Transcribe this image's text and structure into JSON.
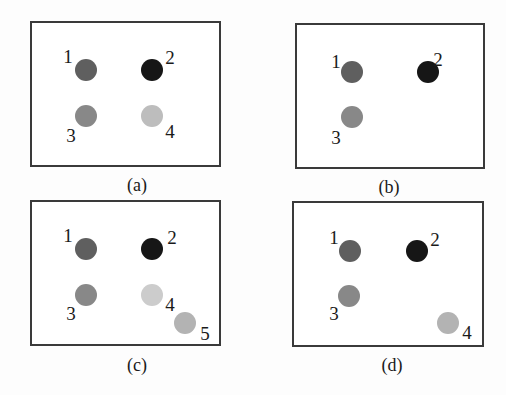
{
  "colors": {
    "dot1": "#5f5f5f",
    "dot2": "#161616",
    "dot3": "#888888",
    "dot4": "#bdbdbd",
    "dot5": "#b3b3b3",
    "border": "#3a3a3a"
  },
  "panels": [
    {
      "caption": "(a)",
      "box": {
        "x": 30,
        "y": 21,
        "w": 191,
        "h": 146
      },
      "caption_pos": {
        "x": 137,
        "y": 176
      },
      "points": [
        {
          "label": "1",
          "color": "#5f5f5f",
          "x": 86,
          "y": 70,
          "lx": 68,
          "ly": 56
        },
        {
          "label": "2",
          "color": "#161616",
          "x": 152,
          "y": 70,
          "lx": 170,
          "ly": 57
        },
        {
          "label": "3",
          "color": "#888888",
          "x": 86,
          "y": 116,
          "lx": 71,
          "ly": 135
        },
        {
          "label": "4",
          "color": "#bdbdbd",
          "x": 152,
          "y": 116,
          "lx": 170,
          "ly": 131
        }
      ]
    },
    {
      "caption": "(b)",
      "box": {
        "x": 295,
        "y": 23,
        "w": 190,
        "h": 146
      },
      "caption_pos": {
        "x": 389,
        "y": 178
      },
      "points": [
        {
          "label": "1",
          "color": "#5f5f5f",
          "x": 352,
          "y": 72,
          "lx": 336,
          "ly": 61
        },
        {
          "label": "2",
          "color": "#161616",
          "x": 428,
          "y": 72,
          "lx": 438,
          "ly": 59
        },
        {
          "label": "3",
          "color": "#888888",
          "x": 352,
          "y": 117,
          "lx": 336,
          "ly": 137
        }
      ]
    },
    {
      "caption": "(c)",
      "box": {
        "x": 30,
        "y": 200,
        "w": 191,
        "h": 146
      },
      "caption_pos": {
        "x": 137,
        "y": 356
      },
      "points": [
        {
          "label": "1",
          "color": "#5f5f5f",
          "x": 86,
          "y": 249,
          "lx": 68,
          "ly": 235
        },
        {
          "label": "2",
          "color": "#161616",
          "x": 152,
          "y": 249,
          "lx": 172,
          "ly": 237
        },
        {
          "label": "3",
          "color": "#888888",
          "x": 86,
          "y": 295,
          "lx": 71,
          "ly": 313
        },
        {
          "label": "4",
          "color": "#cccccc",
          "x": 152,
          "y": 295,
          "lx": 170,
          "ly": 304
        },
        {
          "label": "5",
          "color": "#b3b3b3",
          "x": 185,
          "y": 323,
          "lx": 205,
          "ly": 333
        }
      ]
    },
    {
      "caption": "(d)",
      "box": {
        "x": 292,
        "y": 201,
        "w": 192,
        "h": 146
      },
      "caption_pos": {
        "x": 392,
        "y": 356
      },
      "points": [
        {
          "label": "1",
          "color": "#5f5f5f",
          "x": 350,
          "y": 251,
          "lx": 334,
          "ly": 237
        },
        {
          "label": "2",
          "color": "#161616",
          "x": 417,
          "y": 251,
          "lx": 435,
          "ly": 239
        },
        {
          "label": "3",
          "color": "#888888",
          "x": 349,
          "y": 296,
          "lx": 334,
          "ly": 313
        },
        {
          "label": "4",
          "color": "#b3b3b3",
          "x": 448,
          "y": 323,
          "lx": 467,
          "ly": 332
        }
      ]
    }
  ]
}
